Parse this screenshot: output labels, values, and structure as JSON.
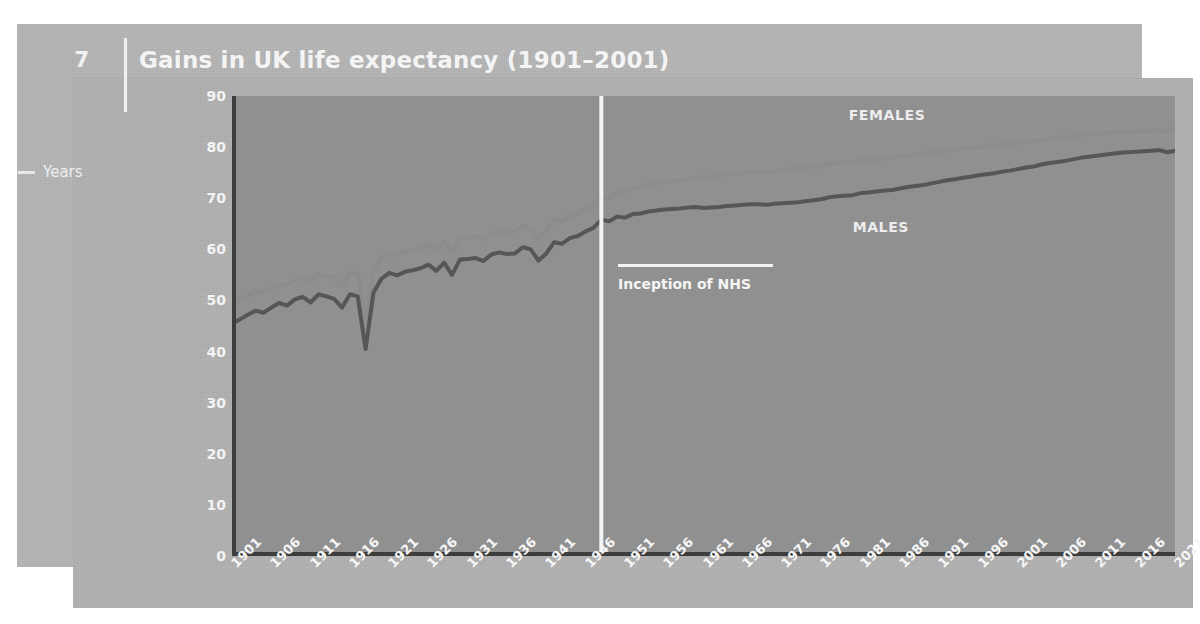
{
  "page": {
    "number": "7",
    "background_color": "#ffffff",
    "panel_color": "#b2b2b2",
    "plot_background_color": "#909090"
  },
  "header": {
    "title": "Gains in UK life expectancy (1901–2001)"
  },
  "axis": {
    "y_title": "Years"
  },
  "annotations": {
    "females_label": "FEMALES",
    "males_label": "MALES",
    "nhs_label": "Inception of NHS",
    "nhs_year": 1948
  },
  "chart_data": {
    "type": "line",
    "title": "Gains in UK life expectancy (1901–2001)",
    "xlabel": "",
    "ylabel": "Years",
    "xlim": [
      1901,
      2021
    ],
    "ylim": [
      0,
      90
    ],
    "ytick_step": 10,
    "yticks": [
      0,
      10,
      20,
      30,
      40,
      50,
      60,
      70,
      80,
      90
    ],
    "xticks": [
      1901,
      1906,
      1911,
      1916,
      1921,
      1926,
      1931,
      1936,
      1941,
      1946,
      1951,
      1956,
      1961,
      1966,
      1971,
      1976,
      1981,
      1986,
      1991,
      1996,
      2001,
      2006,
      2011,
      2016,
      2021
    ],
    "xtick_step": 5,
    "minor_tick_step": 1,
    "grid": false,
    "legend_position": "inline-labels",
    "series": [
      {
        "name": "FEMALES",
        "color": "#8c8c8c",
        "x": [
          1901,
          1902,
          1903,
          1904,
          1905,
          1906,
          1907,
          1908,
          1909,
          1910,
          1911,
          1912,
          1913,
          1914,
          1915,
          1916,
          1917,
          1918,
          1919,
          1920,
          1921,
          1922,
          1923,
          1924,
          1925,
          1926,
          1927,
          1928,
          1929,
          1930,
          1931,
          1932,
          1933,
          1934,
          1935,
          1936,
          1937,
          1938,
          1939,
          1940,
          1941,
          1942,
          1943,
          1944,
          1945,
          1946,
          1947,
          1948,
          1949,
          1950,
          1951,
          1952,
          1953,
          1954,
          1955,
          1956,
          1957,
          1958,
          1959,
          1960,
          1961,
          1962,
          1963,
          1964,
          1965,
          1966,
          1967,
          1968,
          1969,
          1970,
          1971,
          1972,
          1973,
          1974,
          1975,
          1976,
          1977,
          1978,
          1979,
          1980,
          1981,
          1982,
          1983,
          1984,
          1985,
          1986,
          1987,
          1988,
          1989,
          1990,
          1991,
          1992,
          1993,
          1994,
          1995,
          1996,
          1997,
          1998,
          1999,
          2000,
          2001,
          2002,
          2003,
          2004,
          2005,
          2006,
          2007,
          2008,
          2009,
          2010,
          2011,
          2012,
          2013,
          2014,
          2015,
          2016,
          2017,
          2018,
          2019,
          2020,
          2021
        ],
        "y": [
          49.5,
          50.2,
          51.0,
          51.8,
          51.5,
          52.4,
          53.3,
          52.9,
          54.0,
          54.6,
          53.6,
          55.2,
          54.8,
          54.5,
          52.9,
          55.5,
          55.2,
          45.5,
          55.8,
          58.2,
          59.3,
          58.9,
          59.5,
          59.8,
          60.2,
          61.0,
          59.8,
          61.5,
          59.2,
          62.1,
          62.3,
          62.5,
          61.9,
          63.2,
          63.6,
          63.3,
          63.5,
          64.6,
          64.2,
          62.0,
          63.5,
          65.8,
          65.5,
          66.5,
          67.0,
          68.0,
          68.8,
          70.2,
          70.0,
          71.0,
          71.2,
          71.9,
          72.0,
          72.6,
          73.0,
          73.2,
          73.3,
          73.5,
          73.9,
          74.0,
          74.2,
          74.1,
          74.3,
          74.7,
          74.8,
          74.9,
          75.1,
          75.2,
          75.0,
          75.3,
          75.5,
          75.7,
          75.8,
          76.0,
          76.2,
          76.3,
          76.7,
          76.9,
          77.0,
          77.0,
          77.4,
          77.5,
          77.6,
          77.8,
          77.9,
          78.1,
          78.4,
          78.6,
          78.7,
          79.0,
          79.2,
          79.4,
          79.5,
          79.7,
          79.9,
          80.0,
          80.2,
          80.4,
          80.5,
          80.6,
          80.8,
          81.0,
          81.1,
          81.4,
          81.6,
          81.8,
          81.9,
          82.1,
          82.3,
          82.5,
          82.6,
          82.7,
          82.8,
          82.9,
          83.0,
          83.1,
          83.2,
          83.2,
          83.3,
          83.1,
          83.5
        ]
      },
      {
        "name": "MALES",
        "color": "#565656",
        "x": [
          1901,
          1902,
          1903,
          1904,
          1905,
          1906,
          1907,
          1908,
          1909,
          1910,
          1911,
          1912,
          1913,
          1914,
          1915,
          1916,
          1917,
          1918,
          1919,
          1920,
          1921,
          1922,
          1923,
          1924,
          1925,
          1926,
          1927,
          1928,
          1929,
          1930,
          1931,
          1932,
          1933,
          1934,
          1935,
          1936,
          1937,
          1938,
          1939,
          1940,
          1941,
          1942,
          1943,
          1944,
          1945,
          1946,
          1947,
          1948,
          1949,
          1950,
          1951,
          1952,
          1953,
          1954,
          1955,
          1956,
          1957,
          1958,
          1959,
          1960,
          1961,
          1962,
          1963,
          1964,
          1965,
          1966,
          1967,
          1968,
          1969,
          1970,
          1971,
          1972,
          1973,
          1974,
          1975,
          1976,
          1977,
          1978,
          1979,
          1980,
          1981,
          1982,
          1983,
          1984,
          1985,
          1986,
          1987,
          1988,
          1989,
          1990,
          1991,
          1992,
          1993,
          1994,
          1995,
          1996,
          1997,
          1998,
          1999,
          2000,
          2001,
          2002,
          2003,
          2004,
          2005,
          2006,
          2007,
          2008,
          2009,
          2010,
          2011,
          2012,
          2013,
          2014,
          2015,
          2016,
          2017,
          2018,
          2019,
          2020,
          2021
        ],
        "y": [
          45.5,
          46.3,
          47.2,
          48.0,
          47.6,
          48.6,
          49.5,
          49.0,
          50.2,
          50.7,
          49.6,
          51.2,
          50.8,
          50.3,
          48.6,
          51.2,
          50.8,
          40.5,
          51.5,
          54.2,
          55.4,
          54.9,
          55.6,
          55.9,
          56.3,
          57.0,
          55.8,
          57.4,
          55.0,
          58.0,
          58.1,
          58.3,
          57.7,
          59.0,
          59.4,
          59.1,
          59.2,
          60.4,
          60.0,
          57.8,
          59.2,
          61.4,
          61.1,
          62.2,
          62.6,
          63.5,
          64.2,
          65.8,
          65.5,
          66.4,
          66.2,
          66.9,
          67.0,
          67.4,
          67.6,
          67.8,
          67.9,
          68.0,
          68.2,
          68.3,
          68.1,
          68.2,
          68.3,
          68.5,
          68.6,
          68.7,
          68.8,
          68.8,
          68.7,
          68.9,
          69.0,
          69.1,
          69.2,
          69.4,
          69.6,
          69.8,
          70.2,
          70.4,
          70.5,
          70.6,
          71.0,
          71.1,
          71.3,
          71.5,
          71.6,
          71.9,
          72.2,
          72.4,
          72.6,
          72.9,
          73.2,
          73.5,
          73.7,
          74.0,
          74.2,
          74.5,
          74.7,
          74.9,
          75.2,
          75.4,
          75.7,
          76.0,
          76.2,
          76.6,
          76.9,
          77.1,
          77.3,
          77.6,
          77.9,
          78.1,
          78.3,
          78.5,
          78.7,
          78.9,
          79.0,
          79.1,
          79.2,
          79.3,
          79.4,
          79.0,
          79.3
        ]
      }
    ]
  }
}
